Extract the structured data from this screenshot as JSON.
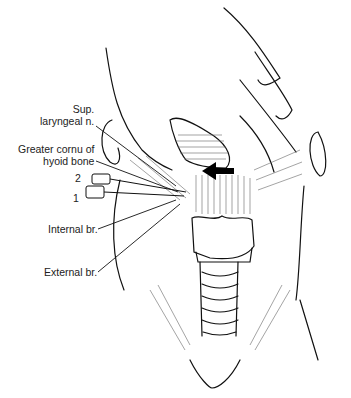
{
  "figure": {
    "labels": {
      "sup_laryngeal_line1": "Sup.",
      "sup_laryngeal_line2": "laryngeal n.",
      "greater_cornu_line1": "Greater cornu of",
      "greater_cornu_line2": "hyoid bone",
      "internal_branch": "Internal br.",
      "external_branch": "External br."
    },
    "needles": [
      {
        "number": "2"
      },
      {
        "number": "1"
      }
    ],
    "arrow": {
      "direction": "left",
      "color": "#000000"
    },
    "colors": {
      "line": "#111111",
      "hatch": "#555555",
      "background": "#ffffff"
    }
  }
}
